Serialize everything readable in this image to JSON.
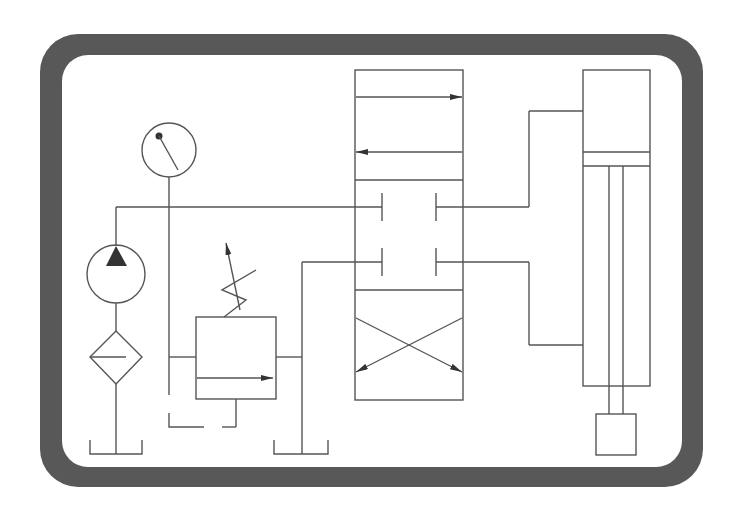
{
  "diagram": {
    "type": "hydraulic-schematic",
    "title": "",
    "colors": {
      "frame": "#585858",
      "panel": "#ffffff",
      "line": "#555555",
      "arrow": "#333333"
    },
    "components": [
      {
        "id": "reservoir-pump",
        "label": "Reservoir (tank)"
      },
      {
        "id": "filter",
        "label": "Filter"
      },
      {
        "id": "pump",
        "label": "Hydraulic pump"
      },
      {
        "id": "pressure-gauge",
        "label": "Pressure gauge"
      },
      {
        "id": "relief-valve",
        "label": "Adjustable pressure relief valve"
      },
      {
        "id": "reservoir-relief",
        "label": "Reservoir (tank)"
      },
      {
        "id": "directional-valve",
        "label": "4/3 directional control valve"
      },
      {
        "id": "cylinder",
        "label": "Double-acting cylinder"
      },
      {
        "id": "load",
        "label": "Load"
      }
    ]
  }
}
